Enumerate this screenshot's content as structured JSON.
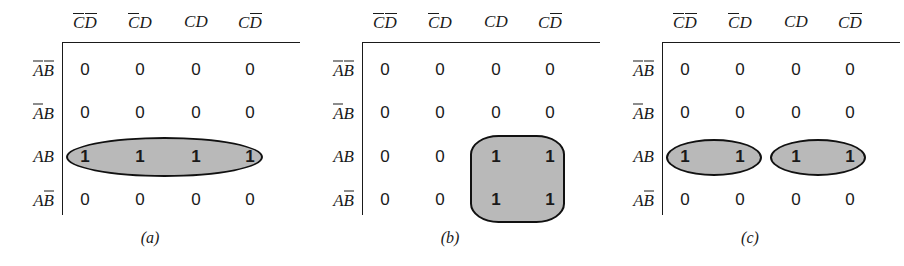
{
  "figure": {
    "type": "karnaugh-map-series",
    "panel_count": 3,
    "colors": {
      "group_fill": "#b9b9b9",
      "group_stroke": "#111111",
      "text": "#1a1a1a",
      "background": "#ffffff"
    }
  },
  "common": {
    "column_headers": [
      {
        "text": "CD",
        "c_bar": true,
        "d_bar": true
      },
      {
        "text": "CD",
        "c_bar": true,
        "d_bar": false
      },
      {
        "text": "CD",
        "c_bar": false,
        "d_bar": false
      },
      {
        "text": "CD",
        "c_bar": false,
        "d_bar": true
      }
    ],
    "row_labels": [
      {
        "text": "AB",
        "a_bar": true,
        "b_bar": true
      },
      {
        "text": "AB",
        "a_bar": true,
        "b_bar": false
      },
      {
        "text": "AB",
        "a_bar": false,
        "b_bar": false
      },
      {
        "text": "AB",
        "a_bar": false,
        "b_bar": true
      }
    ]
  },
  "panels": [
    {
      "id": "a",
      "caption": "(a)",
      "rows": [
        [
          "0",
          "0",
          "0",
          "0"
        ],
        [
          "0",
          "0",
          "0",
          "0"
        ],
        [
          "1",
          "1",
          "1",
          "1"
        ],
        [
          "0",
          "0",
          "0",
          "0"
        ]
      ],
      "groups": [
        {
          "name": "group-row-ab-all-columns",
          "shape": "ellipse",
          "cells": "AB row, all four columns"
        }
      ]
    },
    {
      "id": "b",
      "caption": "(b)",
      "rows": [
        [
          "0",
          "0",
          "0",
          "0"
        ],
        [
          "0",
          "0",
          "0",
          "0"
        ],
        [
          "0",
          "0",
          "1",
          "1"
        ],
        [
          "0",
          "0",
          "1",
          "1"
        ]
      ],
      "groups": [
        {
          "name": "group-ac-block",
          "shape": "rounded-block",
          "cells": "AB and ABbar rows, CD and CDbar columns"
        }
      ]
    },
    {
      "id": "c",
      "caption": "(c)",
      "rows": [
        [
          "0",
          "0",
          "0",
          "0"
        ],
        [
          "0",
          "0",
          "0",
          "0"
        ],
        [
          "1",
          "1",
          "1",
          "1"
        ],
        [
          "0",
          "0",
          "0",
          "0"
        ]
      ],
      "groups": [
        {
          "name": "group-left-pair",
          "shape": "ellipse",
          "cells": "AB row, columns 1 and 2"
        },
        {
          "name": "group-right-pair",
          "shape": "ellipse",
          "cells": "AB row, columns 3 and 4"
        }
      ]
    }
  ],
  "chart_data": {
    "type": "table",
    "title": "",
    "categories": [
      "C̅D̅",
      "C̅D",
      "CD",
      "CD̄"
    ],
    "row_categories": [
      "A̅B̅",
      "A̅B",
      "AB",
      "AB̄"
    ],
    "series": [
      {
        "name": "(a)",
        "values": [
          [
            0,
            0,
            0,
            0
          ],
          [
            0,
            0,
            0,
            0
          ],
          [
            1,
            1,
            1,
            1
          ],
          [
            0,
            0,
            0,
            0
          ]
        ]
      },
      {
        "name": "(b)",
        "values": [
          [
            0,
            0,
            0,
            0
          ],
          [
            0,
            0,
            0,
            0
          ],
          [
            0,
            0,
            1,
            1
          ],
          [
            0,
            0,
            1,
            1
          ]
        ]
      },
      {
        "name": "(c)",
        "values": [
          [
            0,
            0,
            0,
            0
          ],
          [
            0,
            0,
            0,
            0
          ],
          [
            1,
            1,
            1,
            1
          ],
          [
            0,
            0,
            0,
            0
          ]
        ]
      }
    ]
  }
}
